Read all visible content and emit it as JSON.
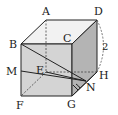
{
  "diagram": {
    "type": "cube",
    "side_label": "2",
    "colors": {
      "top_face": "#f2f2f2",
      "front_face": "#d4d4d4",
      "right_face": "#b4b4b4",
      "edge": "#222222"
    },
    "vertices": {
      "A": {
        "label": "A",
        "x": 46,
        "y": 20
      },
      "D": {
        "label": "D",
        "x": 97,
        "y": 20
      },
      "B": {
        "label": "B",
        "x": 21,
        "y": 44
      },
      "C": {
        "label": "C",
        "x": 72,
        "y": 44
      },
      "E": {
        "label": "E",
        "x": 46,
        "y": 72
      },
      "H": {
        "label": "H",
        "x": 97,
        "y": 72
      },
      "F": {
        "label": "F",
        "x": 21,
        "y": 96
      },
      "G": {
        "label": "G",
        "x": 72,
        "y": 96
      },
      "M": {
        "label": "M",
        "x": 21,
        "y": 71
      },
      "N": {
        "label": "N",
        "x": 86,
        "y": 81
      }
    },
    "segments": [
      "B-N",
      "M-N",
      "E-N"
    ],
    "angle_mark": "G-N"
  }
}
